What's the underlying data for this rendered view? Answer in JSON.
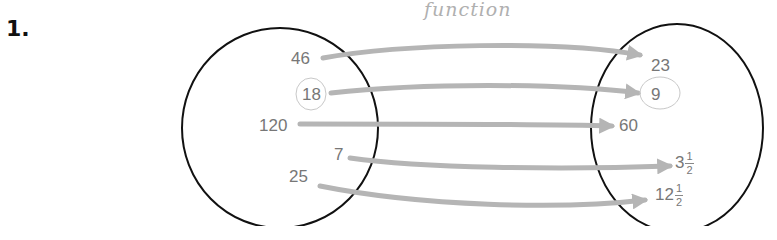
{
  "problem": {
    "number": "1."
  },
  "annotation": {
    "text": "function"
  },
  "domain_set": {
    "values": [
      {
        "label": "46",
        "circled": false
      },
      {
        "label": "18",
        "circled": true
      },
      {
        "label": "120",
        "circled": false
      },
      {
        "label": "7",
        "circled": false
      },
      {
        "label": "25",
        "circled": false
      }
    ]
  },
  "range_set": {
    "values": [
      {
        "label": "23",
        "whole": "23",
        "num": "",
        "den": "",
        "circled": false
      },
      {
        "label": "9",
        "whole": "9",
        "num": "",
        "den": "",
        "circled": true
      },
      {
        "label": "60",
        "whole": "60",
        "num": "",
        "den": "",
        "circled": false
      },
      {
        "label": "3 1/2",
        "whole": "3",
        "num": "1",
        "den": "2",
        "circled": false
      },
      {
        "label": "12 1/2",
        "whole": "12",
        "num": "1",
        "den": "2",
        "circled": false
      }
    ]
  },
  "mappings": [
    {
      "from": "46",
      "to": "23"
    },
    {
      "from": "18",
      "to": "9"
    },
    {
      "from": "120",
      "to": "60"
    },
    {
      "from": "7",
      "to": "3 1/2"
    },
    {
      "from": "25",
      "to": "12 1/2"
    }
  ],
  "colors": {
    "circle": "#111111",
    "arrow": "#b5b5b5",
    "text": "#777777",
    "pencil": "#b0b0b0"
  }
}
